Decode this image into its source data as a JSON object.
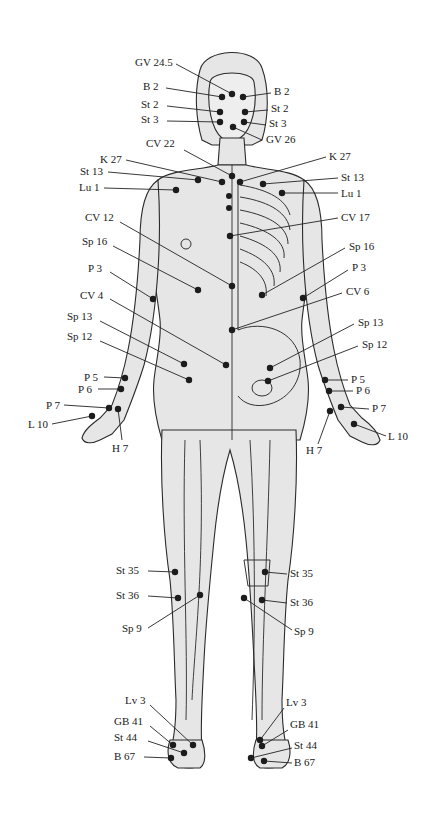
{
  "figure": {
    "colors": {
      "body": "#e6e6e6",
      "outline": "#2b2b2b",
      "point": "#1c1c1c",
      "background": "#ffffff"
    },
    "labels": [
      {
        "id": "gv24_5",
        "text": "GV 24.5",
        "x": 135,
        "y": 66,
        "anchor": "start",
        "px": 232,
        "py": 94,
        "lx": 176,
        "ly": 64
      },
      {
        "id": "b2_l",
        "text": "B 2",
        "x": 143,
        "y": 90,
        "anchor": "start",
        "px": 222,
        "py": 97,
        "lx": 166,
        "ly": 88
      },
      {
        "id": "b2_r",
        "text": "B 2",
        "x": 274,
        "y": 95,
        "anchor": "start",
        "px": 243,
        "py": 97,
        "lx": 271,
        "ly": 93
      },
      {
        "id": "st2_l",
        "text": "St 2",
        "x": 141,
        "y": 108,
        "anchor": "start",
        "px": 220,
        "py": 112,
        "lx": 167,
        "ly": 106
      },
      {
        "id": "st2_r",
        "text": "St 2",
        "x": 271,
        "y": 112,
        "anchor": "start",
        "px": 245,
        "py": 112,
        "lx": 268,
        "ly": 110
      },
      {
        "id": "st3_l",
        "text": "St 3",
        "x": 141,
        "y": 123,
        "anchor": "start",
        "px": 220,
        "py": 122,
        "lx": 167,
        "ly": 121
      },
      {
        "id": "st3_r",
        "text": "St 3",
        "x": 269,
        "y": 127,
        "anchor": "start",
        "px": 244,
        "py": 122,
        "lx": 266,
        "ly": 125
      },
      {
        "id": "gv26",
        "text": "GV 26",
        "x": 266,
        "y": 143,
        "anchor": "start",
        "px": 233,
        "py": 127,
        "lx": 262,
        "ly": 140
      },
      {
        "id": "cv22",
        "text": "CV 22",
        "x": 146,
        "y": 147,
        "anchor": "start",
        "px": 232,
        "py": 176,
        "lx": 184,
        "ly": 150
      },
      {
        "id": "k27_l",
        "text": "K 27",
        "x": 100,
        "y": 163,
        "anchor": "start",
        "px": 222,
        "py": 182,
        "lx": 126,
        "ly": 160
      },
      {
        "id": "k27_r",
        "text": "K 27",
        "x": 329,
        "y": 160,
        "anchor": "start",
        "px": 240,
        "py": 182,
        "lx": 326,
        "ly": 157
      },
      {
        "id": "st13_l",
        "text": "St 13",
        "x": 80,
        "y": 175,
        "anchor": "start",
        "px": 198,
        "py": 180,
        "lx": 108,
        "ly": 172
      },
      {
        "id": "st13_r",
        "text": "St 13",
        "x": 341,
        "y": 181,
        "anchor": "start",
        "px": 263,
        "py": 184,
        "lx": 338,
        "ly": 178
      },
      {
        "id": "lu1_l",
        "text": "Lu 1",
        "x": 79,
        "y": 191,
        "anchor": "start",
        "px": 176,
        "py": 190,
        "lx": 104,
        "ly": 188
      },
      {
        "id": "lu1_r",
        "text": "Lu 1",
        "x": 341,
        "y": 197,
        "anchor": "start",
        "px": 282,
        "py": 193,
        "lx": 338,
        "ly": 193
      },
      {
        "id": "cv17",
        "text": "CV 17",
        "x": 341,
        "y": 221,
        "anchor": "start",
        "px": 230,
        "py": 236,
        "lx": 338,
        "ly": 218
      },
      {
        "id": "cv12",
        "text": "CV 12",
        "x": 85,
        "y": 221,
        "anchor": "start",
        "px": 232,
        "py": 286,
        "lx": 120,
        "ly": 222
      },
      {
        "id": "sp16_l",
        "text": "Sp 16",
        "x": 82,
        "y": 245,
        "anchor": "start",
        "px": 198,
        "py": 290,
        "lx": 113,
        "ly": 246
      },
      {
        "id": "sp16_r",
        "text": "Sp 16",
        "x": 349,
        "y": 250,
        "anchor": "start",
        "px": 262,
        "py": 295,
        "lx": 345,
        "ly": 248
      },
      {
        "id": "p3_l",
        "text": "P 3",
        "x": 88,
        "y": 272,
        "anchor": "start",
        "px": 153,
        "py": 299,
        "lx": 110,
        "ly": 272
      },
      {
        "id": "p3_r",
        "text": "P 3",
        "x": 352,
        "y": 271,
        "anchor": "start",
        "px": 303,
        "py": 298,
        "lx": 348,
        "ly": 270
      },
      {
        "id": "cv6",
        "text": "CV 6",
        "x": 346,
        "y": 295,
        "anchor": "start",
        "px": 232,
        "py": 330,
        "lx": 342,
        "ly": 293
      },
      {
        "id": "cv4",
        "text": "CV 4",
        "x": 80,
        "y": 299,
        "anchor": "start",
        "px": 226,
        "py": 365,
        "lx": 110,
        "ly": 299
      },
      {
        "id": "sp13_l",
        "text": "Sp 13",
        "x": 67,
        "y": 320,
        "anchor": "start",
        "px": 184,
        "py": 364,
        "lx": 100,
        "ly": 321
      },
      {
        "id": "sp13_r",
        "text": "Sp 13",
        "x": 358,
        "y": 326,
        "anchor": "start",
        "px": 270,
        "py": 368,
        "lx": 354,
        "ly": 324
      },
      {
        "id": "sp12_l",
        "text": "Sp 12",
        "x": 67,
        "y": 340,
        "anchor": "start",
        "px": 189,
        "py": 380,
        "lx": 100,
        "ly": 341
      },
      {
        "id": "sp12_r",
        "text": "Sp 12",
        "x": 362,
        "y": 348,
        "anchor": "start",
        "px": 268,
        "py": 381,
        "lx": 358,
        "ly": 346
      },
      {
        "id": "p5_l",
        "text": "P 5",
        "x": 84,
        "y": 381,
        "anchor": "start",
        "px": 125,
        "py": 378,
        "lx": 104,
        "ly": 377
      },
      {
        "id": "p5_r",
        "text": "P 5",
        "x": 351,
        "y": 383,
        "anchor": "start",
        "px": 325,
        "py": 380,
        "lx": 348,
        "ly": 380
      },
      {
        "id": "p6_l",
        "text": "P 6",
        "x": 78,
        "y": 393,
        "anchor": "start",
        "px": 121,
        "py": 389,
        "lx": 98,
        "ly": 389
      },
      {
        "id": "p6_r",
        "text": "P 6",
        "x": 356,
        "y": 394,
        "anchor": "start",
        "px": 329,
        "py": 391,
        "lx": 353,
        "ly": 391
      },
      {
        "id": "p7_l",
        "text": "P 7",
        "x": 46,
        "y": 409,
        "anchor": "start",
        "px": 109,
        "py": 408,
        "lx": 64,
        "ly": 405
      },
      {
        "id": "p7_r",
        "text": "P 7",
        "x": 372,
        "y": 412,
        "anchor": "start",
        "px": 341,
        "py": 407,
        "lx": 369,
        "ly": 409
      },
      {
        "id": "l10_l",
        "text": "L 10",
        "x": 28,
        "y": 428,
        "anchor": "start",
        "px": 92,
        "py": 416,
        "lx": 52,
        "ly": 424
      },
      {
        "id": "l10_r",
        "text": "L 10",
        "x": 388,
        "y": 440,
        "anchor": "start",
        "px": 354,
        "py": 424,
        "lx": 386,
        "ly": 436
      },
      {
        "id": "h7_l",
        "text": "H 7",
        "x": 112,
        "y": 452,
        "anchor": "start",
        "px": 118,
        "py": 409,
        "lx": 122,
        "ly": 440
      },
      {
        "id": "h7_r",
        "text": "H 7",
        "x": 306,
        "y": 454,
        "anchor": "start",
        "px": 330,
        "py": 411,
        "lx": 318,
        "ly": 444
      },
      {
        "id": "st35_l",
        "text": "St 35",
        "x": 116,
        "y": 574,
        "anchor": "start",
        "px": 175,
        "py": 572,
        "lx": 148,
        "ly": 571
      },
      {
        "id": "st35_r",
        "text": "St 35",
        "x": 290,
        "y": 577,
        "anchor": "start",
        "px": 265,
        "py": 572,
        "lx": 287,
        "ly": 574
      },
      {
        "id": "st36_l",
        "text": "St 36",
        "x": 116,
        "y": 599,
        "anchor": "start",
        "px": 178,
        "py": 598,
        "lx": 148,
        "ly": 596
      },
      {
        "id": "st36_r",
        "text": "St 36",
        "x": 290,
        "y": 606,
        "anchor": "start",
        "px": 262,
        "py": 600,
        "lx": 287,
        "ly": 603
      },
      {
        "id": "sp9_l",
        "text": "Sp 9",
        "x": 122,
        "y": 632,
        "anchor": "start",
        "px": 200,
        "py": 595,
        "lx": 148,
        "ly": 628
      },
      {
        "id": "sp9_r",
        "text": "Sp 9",
        "x": 294,
        "y": 635,
        "anchor": "start",
        "px": 244,
        "py": 598,
        "lx": 292,
        "ly": 630
      },
      {
        "id": "lv3_l",
        "text": "Lv 3",
        "x": 125,
        "y": 704,
        "anchor": "start",
        "px": 193,
        "py": 745,
        "lx": 150,
        "ly": 705
      },
      {
        "id": "lv3_r",
        "text": "Lv 3",
        "x": 286,
        "y": 706,
        "anchor": "start",
        "px": 260,
        "py": 740,
        "lx": 284,
        "ly": 708
      },
      {
        "id": "gb41_l",
        "text": "GB 41",
        "x": 114,
        "y": 725,
        "anchor": "start",
        "px": 173,
        "py": 745,
        "lx": 150,
        "ly": 726
      },
      {
        "id": "gb41_r",
        "text": "GB 41",
        "x": 290,
        "y": 728,
        "anchor": "start",
        "px": 262,
        "py": 746,
        "lx": 288,
        "ly": 730
      },
      {
        "id": "st44_l",
        "text": "St 44",
        "x": 114,
        "y": 741,
        "anchor": "start",
        "px": 184,
        "py": 753,
        "lx": 148,
        "ly": 741
      },
      {
        "id": "st44_r",
        "text": "St 44",
        "x": 294,
        "y": 749,
        "anchor": "start",
        "px": 251,
        "py": 758,
        "lx": 292,
        "ly": 748
      },
      {
        "id": "b67_l",
        "text": "B 67",
        "x": 114,
        "y": 760,
        "anchor": "start",
        "px": 171,
        "py": 758,
        "lx": 144,
        "ly": 757
      },
      {
        "id": "b67_r",
        "text": "B 67",
        "x": 294,
        "y": 766,
        "anchor": "start",
        "px": 264,
        "py": 761,
        "lx": 292,
        "ly": 763
      }
    ],
    "extra_points": [
      {
        "px": 229,
        "py": 196
      },
      {
        "px": 229,
        "py": 208
      }
    ]
  }
}
